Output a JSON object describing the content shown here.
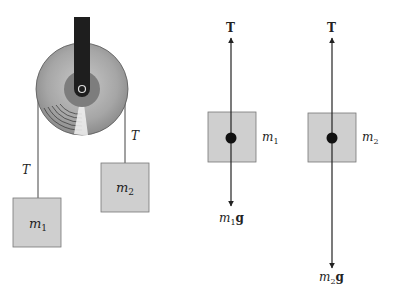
{
  "colors": {
    "box_fill": "#cfcfcf",
    "box_stroke": "#777777",
    "bar": "#1e1e1e",
    "pulley_outer": "#a9a9a9",
    "pulley_hub": "#7d7d7d",
    "line": "#222222"
  },
  "system": {
    "pulley_label": "pulley",
    "tension_left": "T",
    "tension_right": "T",
    "mass1": {
      "base": "m",
      "sub": "1"
    },
    "mass2": {
      "base": "m",
      "sub": "2"
    }
  },
  "fbd1": {
    "tension": "T",
    "mass": {
      "base": "m",
      "sub": "1"
    },
    "weight": {
      "base": "m",
      "sub": "1",
      "vec": "g"
    }
  },
  "fbd2": {
    "tension": "T",
    "mass": {
      "base": "m",
      "sub": "2"
    },
    "weight": {
      "base": "m",
      "sub": "2",
      "vec": "g"
    }
  }
}
